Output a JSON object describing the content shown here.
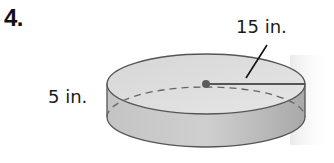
{
  "problem": {
    "number": "4."
  },
  "figure": {
    "shape": "cylinder",
    "radius_label": "15 in.",
    "height_label": "5 in.",
    "colors": {
      "top_fill": "#d9d9d9",
      "side_fill": "#bdbdbd",
      "edge": "#555555",
      "center_dot": "#5a5a5a",
      "radius_line": "#555555",
      "leader_line": "#111111"
    }
  }
}
